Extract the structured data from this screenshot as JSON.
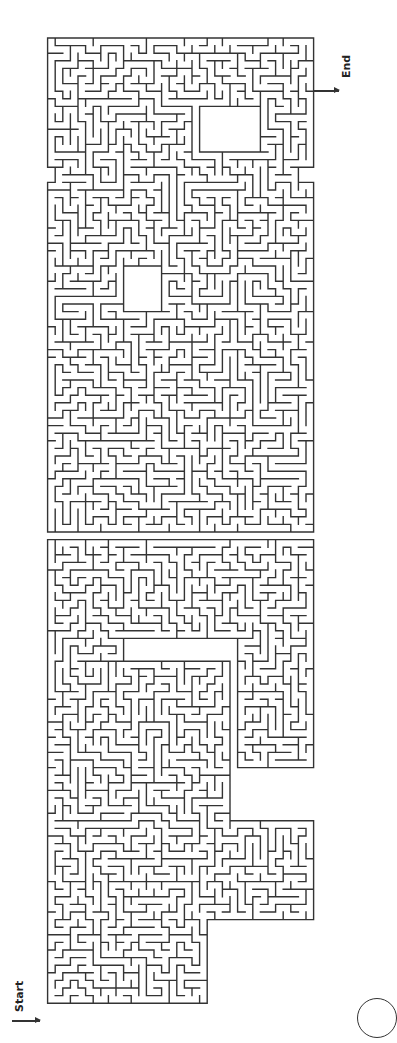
{
  "page": {
    "background": "#ffffff",
    "wall_color": "#333333",
    "start_label": "Start",
    "end_label": "End"
  },
  "maze": {
    "cell": 7.6,
    "orientation": "rotated-90",
    "regions": [
      {
        "x": 47,
        "y": 40,
        "w": 270,
        "h": 130
      },
      {
        "x": 56,
        "y": 168,
        "w": 240,
        "h": 20
      },
      {
        "x": 47,
        "y": 185,
        "w": 270,
        "h": 140
      },
      {
        "x": 47,
        "y": 320,
        "w": 270,
        "h": 100
      },
      {
        "x": 47,
        "y": 420,
        "w": 265,
        "h": 110
      },
      {
        "x": 47,
        "y": 540,
        "w": 265,
        "h": 100
      },
      {
        "x": 47,
        "y": 640,
        "w": 80,
        "h": 180
      },
      {
        "x": 120,
        "y": 660,
        "w": 110,
        "h": 160
      },
      {
        "x": 240,
        "y": 620,
        "w": 70,
        "h": 150
      },
      {
        "x": 47,
        "y": 820,
        "w": 265,
        "h": 100
      },
      {
        "x": 47,
        "y": 920,
        "w": 160,
        "h": 85
      }
    ],
    "holes": [
      {
        "x": 125,
        "y": 265,
        "w": 33,
        "h": 45
      },
      {
        "x": 200,
        "y": 110,
        "w": 60,
        "h": 45
      }
    ]
  },
  "badge": {
    "shape": "circle"
  }
}
